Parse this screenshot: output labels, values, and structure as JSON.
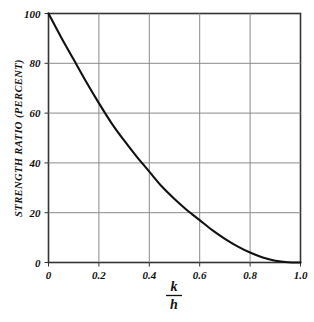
{
  "chart_data": {
    "type": "line",
    "title": "",
    "subtitle": "",
    "xlabel": "k/h",
    "xlabel_numerator": "k",
    "xlabel_denominator": "h",
    "ylabel": "STRENGTH RATIO (PERCENT)",
    "xlim": [
      0,
      1.0
    ],
    "ylim": [
      0,
      100
    ],
    "grid": true,
    "legend": "none",
    "xticks": [
      0,
      0.2,
      0.4,
      0.6,
      0.8,
      1.0
    ],
    "xtick_labels": [
      "0",
      "0.2",
      "0.4",
      "0.6",
      "0.8",
      "1.0"
    ],
    "yticks": [
      0,
      20,
      40,
      60,
      80,
      100
    ],
    "ytick_labels": [
      "0",
      "20",
      "40",
      "60",
      "80",
      "100"
    ],
    "series": [
      {
        "name": "strength ratio",
        "color": "#111111",
        "x": [
          0.0,
          0.05,
          0.1,
          0.15,
          0.2,
          0.25,
          0.3,
          0.35,
          0.4,
          0.45,
          0.5,
          0.55,
          0.6,
          0.65,
          0.7,
          0.75,
          0.8,
          0.85,
          0.9,
          0.95,
          1.0
        ],
        "y": [
          100.0,
          90.5,
          81.5,
          72.5,
          64.0,
          56.0,
          49.0,
          42.5,
          36.5,
          30.5,
          25.5,
          21.0,
          17.0,
          13.0,
          9.5,
          6.5,
          4.0,
          2.0,
          0.7,
          0.1,
          0.0
        ]
      }
    ],
    "annotations": []
  },
  "colors": {
    "background": "#ffffff",
    "frame": "#333333",
    "grid": "#8a8a8a",
    "curve": "#111111",
    "text": "#111111"
  }
}
